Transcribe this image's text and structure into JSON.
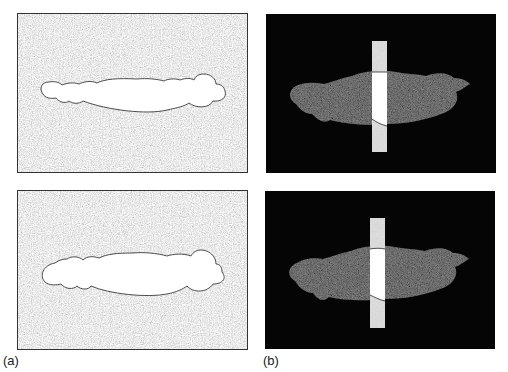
{
  "figure": {
    "colors": {
      "background_noise_gray": "#8a8a8a",
      "region_white": "#ffffff",
      "dark_background": "#050505",
      "dark_region_texture": "#2a2a2a",
      "strip_gray": "#c8c8c8",
      "outline": "#222222"
    },
    "panels": [
      {
        "id": "a-top",
        "description": "gray noisy background with white segmented blob region"
      },
      {
        "id": "a-bottom",
        "description": "gray noisy background with white segmented blob region (variant)"
      },
      {
        "id": "b-top",
        "description": "black background, dark textured blob, vertical gray strip with white intersection"
      },
      {
        "id": "b-bottom",
        "description": "black background, dark textured blob, vertical gray strip with white intersection (variant)"
      }
    ],
    "labels": {
      "a": "(a)",
      "b": "(b)"
    }
  }
}
